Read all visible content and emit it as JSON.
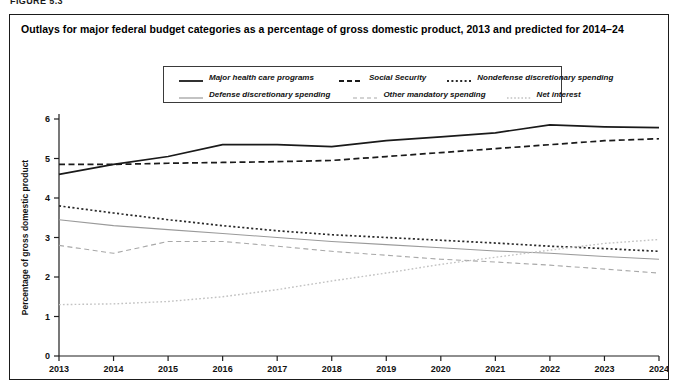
{
  "figure_label": "FIGURE 5.3",
  "panel": {
    "title": "Outlays for major federal budget categories as a percentage of gross domestic product, 2013 and predicted for 2014–24"
  },
  "chart_data": {
    "type": "line",
    "title": "Outlays for major federal budget categories as a percentage of gross domestic product, 2013 and predicted for 2014–24",
    "xlabel": "",
    "ylabel": "Percentage of gross domestic product",
    "x": [
      2013,
      2014,
      2015,
      2016,
      2017,
      2018,
      2019,
      2020,
      2021,
      2022,
      2023,
      2024
    ],
    "xtick_labels": [
      "2013",
      "2014",
      "2015",
      "2016",
      "2017",
      "2018",
      "2019",
      "2020",
      "2021",
      "2022",
      "2023",
      "2024"
    ],
    "ytick_labels": [
      "0",
      "1",
      "2",
      "3",
      "4",
      "5",
      "6"
    ],
    "yticks": [
      0,
      1,
      2,
      3,
      4,
      5,
      6
    ],
    "ylim": [
      0,
      6
    ],
    "xlim": [
      2013,
      2024
    ],
    "grid": false,
    "legend_position": "top-center",
    "series": [
      {
        "name": "Major health care programs",
        "style": "solid",
        "color": "#1a1a1a",
        "width": 1.7,
        "values": [
          4.6,
          4.85,
          5.05,
          5.35,
          5.35,
          5.3,
          5.45,
          5.55,
          5.65,
          5.85,
          5.8,
          5.78
        ]
      },
      {
        "name": "Social Security",
        "style": "dashed",
        "color": "#1a1a1a",
        "width": 1.7,
        "values": [
          4.85,
          4.85,
          4.88,
          4.9,
          4.92,
          4.95,
          5.05,
          5.15,
          5.25,
          5.35,
          5.45,
          5.5
        ]
      },
      {
        "name": "Nondefense discretionary spending",
        "style": "dotted",
        "color": "#2a2a2a",
        "width": 1.7,
        "values": [
          3.8,
          3.62,
          3.45,
          3.3,
          3.17,
          3.07,
          3.0,
          2.93,
          2.86,
          2.78,
          2.72,
          2.65
        ]
      },
      {
        "name": "Defense discretionary spending",
        "style": "solid",
        "color": "#9a9a9a",
        "width": 1.1,
        "values": [
          3.45,
          3.3,
          3.2,
          3.1,
          3.0,
          2.9,
          2.82,
          2.74,
          2.66,
          2.6,
          2.52,
          2.45
        ]
      },
      {
        "name": "Other mandatory spending",
        "style": "dashed",
        "color": "#a8a8a8",
        "width": 1.1,
        "values": [
          2.8,
          2.6,
          2.9,
          2.9,
          2.78,
          2.65,
          2.55,
          2.45,
          2.38,
          2.3,
          2.2,
          2.1
        ]
      },
      {
        "name": "Net interest",
        "style": "dotted",
        "color": "#c2c2c2",
        "width": 1.4,
        "values": [
          1.3,
          1.32,
          1.38,
          1.5,
          1.68,
          1.9,
          2.1,
          2.32,
          2.5,
          2.68,
          2.85,
          2.95
        ]
      }
    ]
  }
}
